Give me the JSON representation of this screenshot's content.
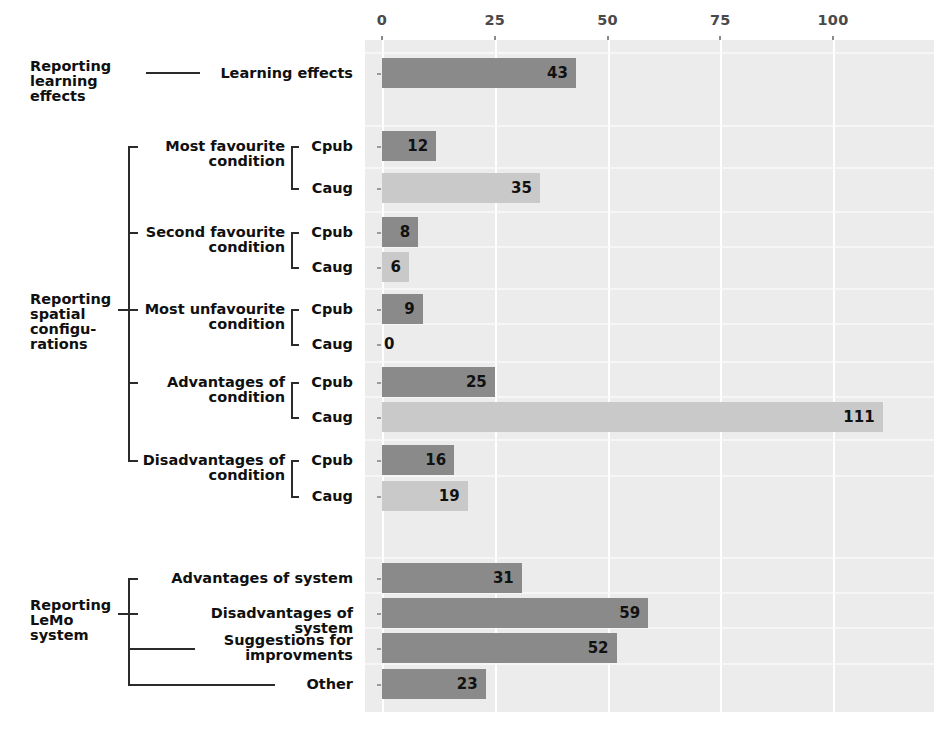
{
  "chart_data": {
    "type": "bar",
    "orientation": "horizontal",
    "title": "",
    "xlabel": "",
    "ylabel": "",
    "xlim": [
      0,
      120
    ],
    "xticks": [
      0,
      25,
      50,
      75,
      100
    ],
    "xtick_labels": [
      "0",
      "25",
      "50",
      "75",
      "100"
    ],
    "grid": true,
    "grid_color": "#ffffff",
    "plot_background": "#ececec",
    "legend": null,
    "series_colors": {
      "Cpub": "#8a8a8a",
      "Caug": "#c9c9c9",
      "single": "#8a8a8a"
    },
    "categories": [
      "Learning effects",
      "Most favourite condition - Cpub",
      "Most favourite condition - Caug",
      "Second favourite condition - Cpub",
      "Second favourite condition - Caug",
      "Most unfavourite condition - Cpub",
      "Most unfavourite condition - Caug",
      "Advantages of condition - Cpub",
      "Advantages of condition - Caug",
      "Disadvantages of condition - Cpub",
      "Disadvantages of condition - Caug",
      "Advantages of system",
      "Disadvantages of system",
      "Suggestions for improvments",
      "Other"
    ],
    "values": [
      43,
      12,
      35,
      8,
      6,
      9,
      0,
      25,
      111,
      16,
      19,
      31,
      59,
      52,
      23
    ]
  },
  "axis": {
    "ticks": [
      {
        "label": "0",
        "value": 0
      },
      {
        "label": "25",
        "value": 25
      },
      {
        "label": "50",
        "value": 50
      },
      {
        "label": "75",
        "value": 75
      },
      {
        "label": "100",
        "value": 100
      }
    ]
  },
  "groups": [
    {
      "id": "learning",
      "label": "Reporting\nlearning\neffects"
    },
    {
      "id": "spatial",
      "label": "Reporting\nspatial\nconfigu-\nrations"
    },
    {
      "id": "lemo",
      "label": "Reporting\nLeMo\nsystem"
    }
  ],
  "subgroups": [
    {
      "id": "most-favourite",
      "label": "Most favourite\ncondition"
    },
    {
      "id": "second-favourite",
      "label": "Second favourite\ncondition"
    },
    {
      "id": "most-unfavourite",
      "label": "Most unfavourite\ncondition"
    },
    {
      "id": "advantages-condition",
      "label": "Advantages of\ncondition"
    },
    {
      "id": "disadvantages-condition",
      "label": "Disadvantages of\ncondition"
    }
  ],
  "rows": [
    {
      "id": "learning-effects",
      "label": "Learning effects",
      "value": 43,
      "value_label": "43",
      "series": "single",
      "inside": true
    },
    {
      "id": "most-fav-cpub",
      "label": "Cpub",
      "value": 12,
      "value_label": "12",
      "series": "Cpub",
      "inside": true
    },
    {
      "id": "most-fav-caug",
      "label": "Caug",
      "value": 35,
      "value_label": "35",
      "series": "Caug",
      "inside": true
    },
    {
      "id": "second-fav-cpub",
      "label": "Cpub",
      "value": 8,
      "value_label": "8",
      "series": "Cpub",
      "inside": true
    },
    {
      "id": "second-fav-caug",
      "label": "Caug",
      "value": 6,
      "value_label": "6",
      "series": "Caug",
      "inside": true
    },
    {
      "id": "most-unfav-cpub",
      "label": "Cpub",
      "value": 9,
      "value_label": "9",
      "series": "Cpub",
      "inside": true
    },
    {
      "id": "most-unfav-caug",
      "label": "Caug",
      "value": 0,
      "value_label": "0",
      "series": "Caug",
      "inside": false
    },
    {
      "id": "adv-cond-cpub",
      "label": "Cpub",
      "value": 25,
      "value_label": "25",
      "series": "Cpub",
      "inside": true
    },
    {
      "id": "adv-cond-caug",
      "label": "Caug",
      "value": 111,
      "value_label": "111",
      "series": "Caug",
      "inside": true
    },
    {
      "id": "disadv-cond-cpub",
      "label": "Cpub",
      "value": 16,
      "value_label": "16",
      "series": "Cpub",
      "inside": true
    },
    {
      "id": "disadv-cond-caug",
      "label": "Caug",
      "value": 19,
      "value_label": "19",
      "series": "Caug",
      "inside": true
    },
    {
      "id": "adv-system",
      "label": "Advantages of system",
      "value": 31,
      "value_label": "31",
      "series": "single",
      "inside": true
    },
    {
      "id": "disadv-system",
      "label": "Disadvantages of system",
      "value": 59,
      "value_label": "59",
      "series": "single",
      "inside": true
    },
    {
      "id": "suggestions",
      "label": "Suggestions for\nimprovments",
      "value": 52,
      "value_label": "52",
      "series": "single",
      "inside": true
    },
    {
      "id": "other",
      "label": "Other",
      "value": 23,
      "value_label": "23",
      "series": "single",
      "inside": true
    }
  ]
}
